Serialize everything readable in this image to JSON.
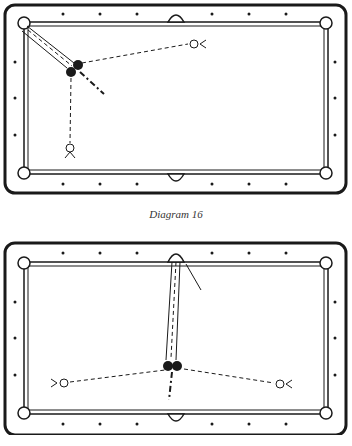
{
  "diagrams": [
    {
      "id": "top",
      "caption": "Diagram 16",
      "balls": [
        {
          "role": "object-ball",
          "x": 78,
          "y": 65
        },
        {
          "role": "cue-ball",
          "x": 71,
          "y": 72
        }
      ],
      "targets": [
        {
          "role": "position-marker-right",
          "x": 194,
          "y": 44
        },
        {
          "role": "position-marker-bottom",
          "x": 70,
          "y": 148
        }
      ]
    },
    {
      "id": "bottom",
      "caption": "",
      "balls": [
        {
          "role": "object-ball",
          "x": 170,
          "y": 365
        },
        {
          "role": "cue-ball",
          "x": 178,
          "y": 365
        }
      ],
      "targets": [
        {
          "role": "position-marker-left",
          "x": 64,
          "y": 383
        },
        {
          "role": "position-marker-right",
          "x": 280,
          "y": 383
        }
      ]
    }
  ],
  "colors": {
    "line": "#1a1a1a",
    "background": "#ffffff"
  }
}
